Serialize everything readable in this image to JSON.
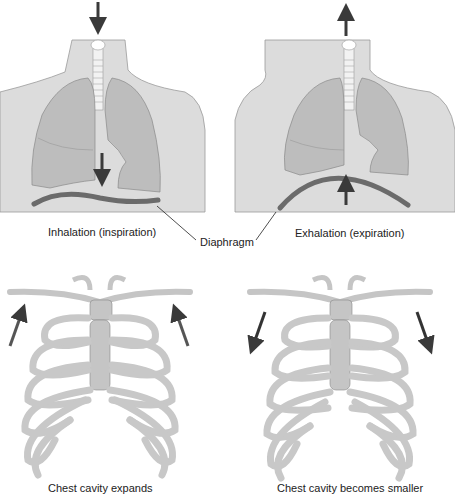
{
  "labels": {
    "inhalation": "Inhalation (inspiration)",
    "exhalation": "Exhalation (expiration)",
    "diaphragm": "Diaphragm",
    "chest_expands": "Chest cavity expands",
    "chest_smaller": "Chest cavity becomes smaller"
  },
  "colors": {
    "skin": "#d9d9d9",
    "lung": "#bdbdbd",
    "diaphragm": "#6b6b6b",
    "arrow": "#3a3a3a",
    "rib": "#cfcfcf",
    "cartilage": "#bcbcbc"
  }
}
